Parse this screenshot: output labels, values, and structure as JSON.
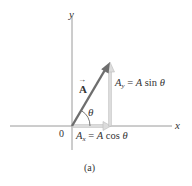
{
  "diagram": {
    "axes": {
      "x_label": "x",
      "y_label": "y",
      "origin_label": "0"
    },
    "vector": {
      "name": "A",
      "arrow": "→",
      "color": "#6e6e6e"
    },
    "angle_label": "θ",
    "components": {
      "y": {
        "symbol": "A",
        "sub": "y",
        "equals": "= ",
        "expr_A": "A",
        "expr_fn": " sin ",
        "expr_theta": "θ",
        "color": "#d6d6d6"
      },
      "x": {
        "symbol": "A",
        "sub": "x",
        "equals": "= ",
        "expr_A": "A",
        "expr_fn": " cos ",
        "expr_theta": "θ",
        "color": "#d6d6d6"
      }
    },
    "caption": "(a)"
  }
}
